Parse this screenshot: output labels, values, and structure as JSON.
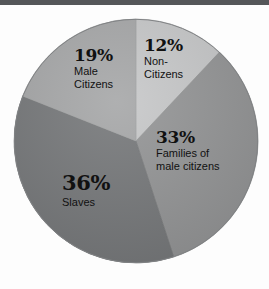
{
  "figure": {
    "background_color": "#fdfdfd",
    "top_rule_color": "#555759"
  },
  "chart_data": {
    "type": "pie",
    "title": "",
    "subtitle": "",
    "xlabel": "",
    "ylabel": "",
    "legend_position": "none",
    "labels_position": "inside-slices",
    "grid": false,
    "units": "percent",
    "total": 100,
    "start_angle_deg": 0,
    "direction": "clockwise",
    "categories": [
      "Non-Citizens",
      "Families of male citizens",
      "Slaves",
      "Male Citizens"
    ],
    "values": [
      12,
      33,
      36,
      19
    ],
    "colors": [
      "#c7c8c9",
      "#949596",
      "#76787a",
      "#a6a7a8"
    ],
    "slices": [
      {
        "name": "Non-Citizens",
        "value": 12,
        "percent_label": "12%",
        "caption_lines": [
          "Non-",
          "Citizens"
        ],
        "color": "#c7c8c9",
        "start_angle_deg": 0,
        "end_angle_deg": 43.2
      },
      {
        "name": "Families of male citizens",
        "value": 33,
        "percent_label": "33%",
        "caption_lines": [
          "Families of",
          "male citizens"
        ],
        "color": "#949596",
        "start_angle_deg": 43.2,
        "end_angle_deg": 162
      },
      {
        "name": "Slaves",
        "value": 36,
        "percent_label": "36%",
        "caption_lines": [
          "Slaves"
        ],
        "color": "#76787a",
        "start_angle_deg": 162,
        "end_angle_deg": 291.6
      },
      {
        "name": "Male Citizens",
        "value": 19,
        "percent_label": "19%",
        "caption_lines": [
          "Male",
          "Citizens"
        ],
        "color": "#a6a7a8",
        "start_angle_deg": 291.6,
        "end_angle_deg": 360
      }
    ]
  }
}
